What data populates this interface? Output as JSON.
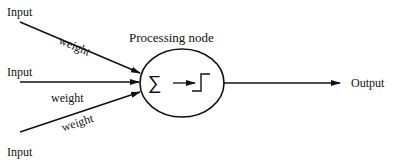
{
  "diagram": {
    "title": "Processing node",
    "inputs": [
      {
        "label": "Input",
        "weight_label": "weight"
      },
      {
        "label": "Input",
        "weight_label": "weight"
      },
      {
        "label": "Input",
        "weight_label": "weight"
      }
    ],
    "node": {
      "summation_symbol": "∑",
      "activation": "step-function-icon"
    },
    "output": {
      "label": "Output"
    },
    "colors": {
      "stroke": "#111111",
      "background": "#ffffff"
    }
  }
}
